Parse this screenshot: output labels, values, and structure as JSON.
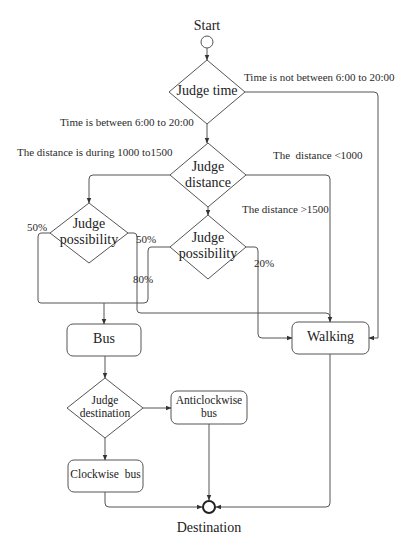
{
  "diagram": {
    "type": "flowchart",
    "colors": {
      "line": "#555555",
      "text": "#222222",
      "background": "#ffffff"
    },
    "nodes": {
      "start": {
        "label": "Start",
        "shape": "circle"
      },
      "judge_time": {
        "label": "Judge time",
        "shape": "diamond"
      },
      "judge_distance": {
        "line1": "Judge",
        "line2": "distance",
        "shape": "diamond"
      },
      "judge_possibility_left": {
        "line1": "Judge",
        "line2": "possibility",
        "shape": "diamond"
      },
      "judge_possibility_right": {
        "line1": "Judge",
        "line2": "possibility",
        "shape": "diamond"
      },
      "bus": {
        "label": "Bus",
        "shape": "rounded-rect"
      },
      "walking": {
        "label": "Walking",
        "shape": "rounded-rect"
      },
      "judge_destination": {
        "line1": "Judge",
        "line2": "destination",
        "shape": "diamond"
      },
      "anticlockwise_bus": {
        "line1": "Anticlockwise",
        "line2": "bus",
        "shape": "rounded-rect"
      },
      "clockwise_bus": {
        "label": "Clockwise  bus",
        "shape": "rounded-rect"
      },
      "destination": {
        "label": "Destination",
        "shape": "circle"
      }
    },
    "edge_labels": {
      "time_not_between": "Time is not between 6:00 to 20:00",
      "time_between": "Time is between 6:00 to 20:00",
      "distance_during": "The distance is during 1000 to1500",
      "distance_lt_1000": "The  distance <1000",
      "distance_gt_1500": "The distance >1500",
      "left_50_a": "50%",
      "left_50_b": "50%",
      "right_80": "80%",
      "right_20": "20%"
    }
  }
}
